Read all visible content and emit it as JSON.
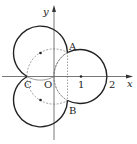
{
  "diagram": {
    "axes": {
      "x_label": "x",
      "y_label": "y"
    },
    "points": {
      "A": "A",
      "B": "B",
      "C": "C",
      "O": "O"
    },
    "ticks": [
      "1",
      "2"
    ],
    "circles": [
      {
        "name": "right",
        "center": [
          1,
          0
        ],
        "radius": 1
      },
      {
        "name": "upper-left",
        "center": [
          -0.5,
          0.866
        ],
        "radius": 1
      },
      {
        "name": "lower-left",
        "center": [
          -0.5,
          -0.866
        ],
        "radius": 1
      }
    ],
    "stroke_color": "#222222",
    "dashed_color": "#777777"
  }
}
